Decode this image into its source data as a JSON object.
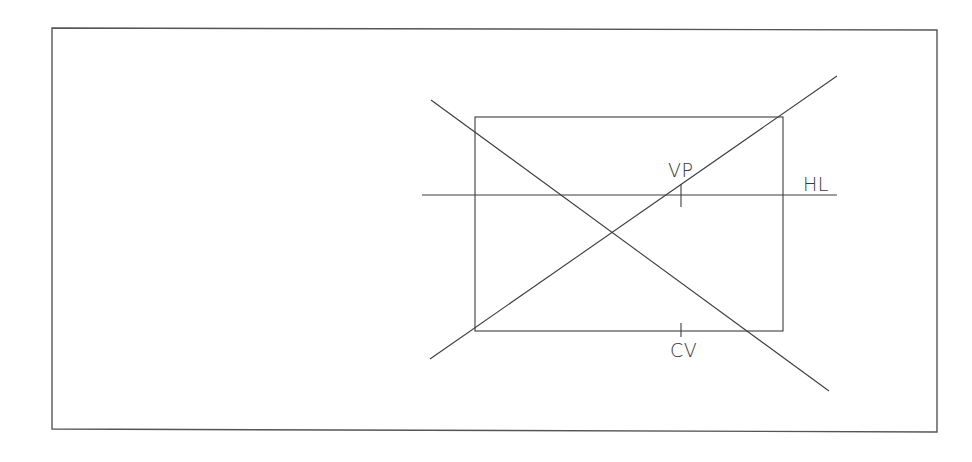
{
  "diagram": {
    "colors": {
      "line": "#3c3c3c",
      "frame": "#555555",
      "background": "#ffffff",
      "text": "#3a3a3a"
    },
    "frame": {
      "x1": 52,
      "y1": 28,
      "x2": 937,
      "y2": 430
    },
    "rectangle": {
      "x1": 475,
      "y1": 117,
      "x2": 783,
      "y2": 331
    },
    "horizon_line": {
      "x1": 422,
      "y1": 195,
      "x2": 837,
      "y2": 195,
      "label": "HL"
    },
    "vanishing_point": {
      "x": 681,
      "y": 195,
      "label": "VP"
    },
    "center_of_vision": {
      "x": 681,
      "y": 330,
      "label": "CV"
    },
    "diagonals": [
      {
        "name": "upper-left-to-lower-right",
        "x1": 431,
        "y1": 100,
        "x2": 829,
        "y2": 391
      },
      {
        "name": "lower-left-to-upper-right",
        "x1": 430,
        "y1": 359,
        "x2": 837,
        "y2": 76
      }
    ],
    "labels": {
      "vp": "VP",
      "hl": "HL",
      "cv": "CV"
    }
  }
}
